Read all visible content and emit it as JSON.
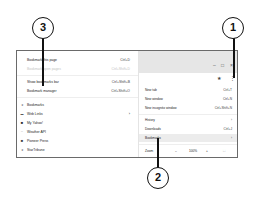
{
  "bookmarks_submenu": {
    "items": [
      {
        "label": "Bookmark this page",
        "shortcut": "Ctrl+D",
        "disabled": false
      },
      {
        "label": "Bookmark open pages",
        "shortcut": "Ctrl+Shift+D",
        "disabled": true
      },
      {
        "label": "Show bookmarks bar",
        "shortcut": "Ctrl+Shift+B",
        "disabled": false
      },
      {
        "label": "Bookmark manager",
        "shortcut": "Ctrl+Shift+O",
        "disabled": false
      }
    ],
    "bookmarks": [
      {
        "icon": "star-icon",
        "glyph": "★",
        "label": "Bookmarks",
        "has_arrow": false
      },
      {
        "icon": "folder-icon",
        "glyph": "▬",
        "label": "Web Links",
        "has_arrow": true
      },
      {
        "icon": "yahoo-icon",
        "glyph": "■",
        "label": "My Yahoo!",
        "has_arrow": false
      },
      {
        "icon": "weather-icon",
        "glyph": "~",
        "label": "Weather API",
        "has_arrow": false
      },
      {
        "icon": "pioneer-press-icon",
        "glyph": "■",
        "label": "Pioneer Press",
        "has_arrow": false
      },
      {
        "icon": "startribune-icon",
        "glyph": "★",
        "label": "StarTribune",
        "has_arrow": false
      }
    ],
    "submenu_arrow": "›"
  },
  "browser_window": {
    "controls": {
      "minimize": "–",
      "maximize": "□",
      "close": "×"
    },
    "toolbar": {
      "star": "★",
      "menu": "⋮"
    }
  },
  "main_menu": {
    "items": [
      {
        "label": "New tab",
        "shortcut": "Ctrl+T"
      },
      {
        "label": "New window",
        "shortcut": "Ctrl+N"
      },
      {
        "label": "New incognito window",
        "shortcut": "Ctrl+Shift+N"
      },
      {
        "label": "History",
        "shortcut": "›"
      },
      {
        "label": "Downloads",
        "shortcut": "Ctrl+J"
      },
      {
        "label": "Bookmarks",
        "shortcut": "›"
      }
    ],
    "zoom": {
      "label": "Zoom",
      "minus": "–",
      "value": "100%",
      "plus": "+",
      "fullscreen": "⛶"
    }
  },
  "callouts": [
    {
      "number": "1"
    },
    {
      "number": "2"
    },
    {
      "number": "3"
    }
  ]
}
